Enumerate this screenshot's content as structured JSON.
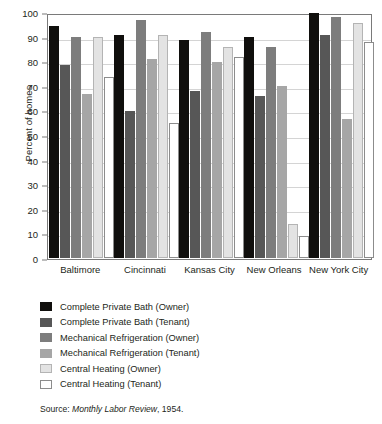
{
  "chart_data": {
    "type": "bar",
    "title": "",
    "subtitle": "",
    "xlabel": "",
    "ylabel": "Percent of homes",
    "ylim": [
      0,
      100
    ],
    "yticks": [
      0,
      10,
      20,
      30,
      40,
      50,
      60,
      70,
      80,
      90,
      100
    ],
    "ytick_labels": [
      "0",
      "10",
      "20",
      "30",
      "40",
      "50",
      "60",
      "70",
      "80",
      "90",
      "100"
    ],
    "grid": true,
    "legend_position": "below-plot",
    "categories": [
      "Baltimore",
      "Cincinnati",
      "Kansas City",
      "New Orleans",
      "New York City"
    ],
    "series": [
      {
        "name": "Complete Private Bath (Owner)",
        "color": "#100f0d",
        "values": [
          94.5,
          90.7,
          88.7,
          89.8,
          99.5
        ]
      },
      {
        "name": "Complete Private Bath (Tenant)",
        "color": "#575757",
        "values": [
          78.5,
          59.8,
          67.7,
          65.8,
          90.5
        ]
      },
      {
        "name": "Mechanical Refrigeration (Owner)",
        "color": "#7d7d7d",
        "values": [
          90.0,
          96.7,
          91.7,
          85.8,
          98.0
        ]
      },
      {
        "name": "Mechanical Refrigeration (Tenant)",
        "color": "#a6a6a6",
        "values": [
          66.5,
          80.7,
          79.8,
          69.8,
          56.5
        ]
      },
      {
        "name": "Central Heating (Owner)",
        "color": "#e3e3e3",
        "values": [
          90.0,
          90.8,
          85.8,
          14.0,
          95.5
        ]
      },
      {
        "name": "Central Heating (Tenant)",
        "color": "#ffffff",
        "values": [
          73.5,
          54.8,
          81.7,
          9.0,
          88.0
        ]
      }
    ]
  },
  "source": {
    "prefix": "Source: ",
    "publication": "Monthly Labor Review",
    "suffix": ", 1954."
  }
}
